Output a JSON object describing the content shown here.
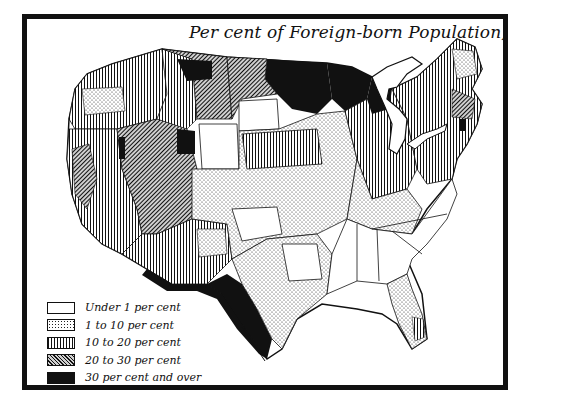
{
  "map": {
    "title": "Per cent of Foreign-born Population, 1900",
    "legend": {
      "items": [
        {
          "key": "under1",
          "label": "Under 1 per cent",
          "pattern": "blank",
          "color": "#ffffff"
        },
        {
          "key": "1to10",
          "label": "1 to 10 per cent",
          "pattern": "dots",
          "color": "#222222"
        },
        {
          "key": "10to20",
          "label": "10 to 20 per cent",
          "pattern": "vertical-lines",
          "color": "#111111"
        },
        {
          "key": "20to30",
          "label": "20 to 30 per cent",
          "pattern": "diagonal-lines",
          "color": "#555555"
        },
        {
          "key": "30plus",
          "label": "30 per cent and over",
          "pattern": "solid",
          "color": "#111111"
        }
      ]
    },
    "colors": {
      "ink": "#111111",
      "paper": "#ffffff",
      "hatch_gray": "#cfcfcf"
    },
    "regions": [
      {
        "name": "pacific-northwest",
        "category": "10to20"
      },
      {
        "name": "california",
        "category": "10to20"
      },
      {
        "name": "nevada-utah-interior",
        "category": "20to30"
      },
      {
        "name": "southwest-border",
        "category": "30plus"
      },
      {
        "name": "northern-plains-border",
        "category": "30plus"
      },
      {
        "name": "central-plains",
        "category": "1to10"
      },
      {
        "name": "midwest",
        "category": "10to20"
      },
      {
        "name": "upper-great-lakes",
        "category": "30plus"
      },
      {
        "name": "northeast",
        "category": "10to20"
      },
      {
        "name": "south",
        "category": "under1"
      },
      {
        "name": "texas-central",
        "category": "1to10"
      },
      {
        "name": "florida",
        "category": "1to10"
      }
    ]
  }
}
